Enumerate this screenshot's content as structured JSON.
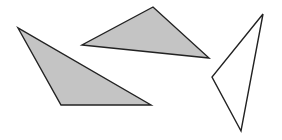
{
  "diagram": {
    "width": 282,
    "height": 140,
    "background": "#ffffff",
    "stroke_color": "#222222",
    "stroke_width": 1.4,
    "shapes": [
      {
        "id": "left-triangle",
        "type": "triangle",
        "fill": "#c4c4c4",
        "points": [
          [
            18,
            28
          ],
          [
            61,
            105
          ],
          [
            151,
            105
          ]
        ]
      },
      {
        "id": "middle-triangle",
        "type": "triangle",
        "fill": "#c4c4c4",
        "points": [
          [
            153,
            7
          ],
          [
            82,
            45
          ],
          [
            209,
            58
          ]
        ]
      },
      {
        "id": "right-triangle",
        "type": "triangle",
        "fill": "#ffffff",
        "points": [
          [
            263,
            14
          ],
          [
            212,
            77
          ],
          [
            241,
            131
          ]
        ]
      }
    ]
  }
}
